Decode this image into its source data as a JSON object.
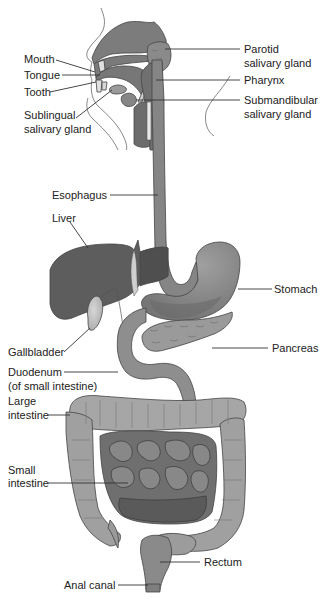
{
  "diagram": {
    "colors": {
      "organ_dark": "#6e6e6e",
      "organ_mid": "#8c8c8c",
      "organ_light": "#a8a8a8",
      "large_intestine": "#a4a4a4",
      "gallbladder": "#c4c4c4",
      "liver": "#5f5f5f",
      "small_intestine": "#7a7a7a",
      "line": "#333333",
      "text": "#222222",
      "background": "#ffffff"
    },
    "labels": {
      "mouth": "Mouth",
      "tongue": "Tongue",
      "tooth": "Tooth",
      "sublingual_1": "Sublingual",
      "sublingual_2": "salivary gland",
      "parotid_1": "Parotid",
      "parotid_2": "salivary gland",
      "pharynx": "Pharynx",
      "submandibular_1": "Submandibular",
      "submandibular_2": "salivary gland",
      "esophagus": "Esophagus",
      "liver": "Liver",
      "stomach": "Stomach",
      "gallbladder": "Gallbladder",
      "pancreas": "Pancreas",
      "duodenum_1": "Duodenum",
      "duodenum_2": "(of small intestine)",
      "large_intestine_1": "Large",
      "large_intestine_2": "intestine",
      "small_intestine_1": "Small",
      "small_intestine_2": "intestine",
      "rectum": "Rectum",
      "anal_canal": "Anal canal"
    }
  }
}
